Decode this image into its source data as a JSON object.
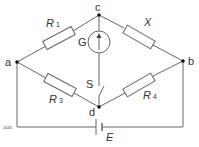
{
  "diagram": {
    "type": "wheatstone-bridge",
    "nodes": {
      "a": "a",
      "b": "b",
      "c": "c",
      "d": "d"
    },
    "resistors": {
      "r1": {
        "name": "R",
        "sub": "1"
      },
      "x": {
        "name": "X"
      },
      "r3": {
        "name": "R",
        "sub": "3"
      },
      "r4": {
        "name": "R",
        "sub": "4"
      }
    },
    "galvanometer": "G",
    "switch": "S",
    "battery": "E",
    "figure_number": "1635",
    "colors": {
      "wire": "#555555",
      "background": "#ffffff"
    }
  }
}
